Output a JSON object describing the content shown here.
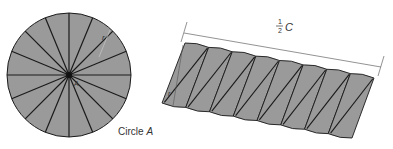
{
  "diagram": {
    "colors": {
      "fill": "#9a9a9a",
      "stroke": "#1a1a1a",
      "dimension_line": "#777777",
      "text": "#333333"
    },
    "circle": {
      "name": "Circle",
      "name_letter": "A",
      "sector_count": 16,
      "radius_label": "r",
      "center_label": "A"
    },
    "parallelogram": {
      "piece_count": 16,
      "radius_label": "r",
      "length_label": {
        "numerator": "1",
        "denominator": "2",
        "variable": "C"
      }
    }
  }
}
